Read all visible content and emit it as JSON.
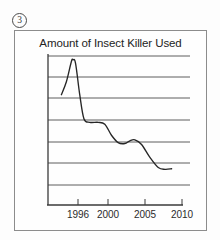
{
  "page": {
    "question_number": "3",
    "question_number_glyph": "circled-3"
  },
  "frame": {
    "border_color": "#8c8c8c",
    "background": "#fefefe"
  },
  "chart_data": {
    "type": "line",
    "title": "Amount of Insect Killer Used",
    "xlabel": "",
    "ylabel": "",
    "xlim": [
      1993,
      2010
    ],
    "ylim": [
      0,
      7
    ],
    "grid": true,
    "gridlines_horizontal": 7,
    "y_axis_tick_labels": [],
    "legend": null,
    "x_tick_labels": [
      "1996",
      "2000",
      "2005",
      "2010"
    ],
    "x_ticks": [
      1996,
      2000,
      2005,
      2010
    ],
    "series": [
      {
        "name": "Insect Killer Used",
        "color": "#262626",
        "x": [
          1994.6,
          1995.2,
          1995.8,
          1996.0,
          1996.3,
          1996.8,
          1997.3,
          1998.0,
          1999.0,
          1999.8,
          2000.6,
          2001.4,
          2002.2,
          2002.8,
          2003.4,
          2004.2,
          2005.2,
          2006.2,
          2007.0,
          2007.8
        ],
        "y": [
          4.9,
          5.6,
          6.7,
          6.8,
          6.6,
          4.9,
          3.6,
          3.4,
          3.4,
          3.3,
          2.7,
          2.3,
          2.25,
          2.4,
          2.45,
          2.2,
          1.5,
          0.95,
          0.85,
          0.88
        ]
      }
    ],
    "annotations": []
  },
  "axis_colors": {
    "axis_line": "#3a3a3a",
    "gridline": "#4d4d4d",
    "curve": "#262626"
  }
}
